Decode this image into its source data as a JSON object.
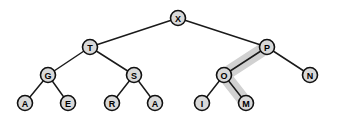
{
  "figure": {
    "kind": "binary-search-tree-diagram",
    "background_color": "#ffffff",
    "width": 338,
    "height": 125
  },
  "style": {
    "node_fill": "#d9d9d9",
    "node_stroke": "#111111",
    "edge_color": "#1a1a1a",
    "highlight_color": "#c9c9c9",
    "label_color": "#000000",
    "node_radius": 7.5
  },
  "nodes": [
    {
      "id": "X",
      "label": "X",
      "x": 178,
      "y": 18,
      "r": 7.5,
      "highlighted": false
    },
    {
      "id": "T",
      "label": "T",
      "x": 90,
      "y": 47,
      "r": 7.5,
      "highlighted": false
    },
    {
      "id": "P",
      "label": "P",
      "x": 267,
      "y": 47,
      "r": 7.5,
      "highlighted": true
    },
    {
      "id": "G",
      "label": "G",
      "x": 48,
      "y": 75,
      "r": 7.5,
      "highlighted": false
    },
    {
      "id": "S",
      "label": "S",
      "x": 134,
      "y": 75,
      "r": 7.5,
      "highlighted": false
    },
    {
      "id": "O",
      "label": "O",
      "x": 224,
      "y": 75,
      "r": 7.5,
      "highlighted": true
    },
    {
      "id": "N",
      "label": "N",
      "x": 310,
      "y": 75,
      "r": 7.5,
      "highlighted": false
    },
    {
      "id": "A1",
      "label": "A",
      "x": 25,
      "y": 103,
      "r": 7.5,
      "highlighted": false
    },
    {
      "id": "E",
      "label": "E",
      "x": 68,
      "y": 103,
      "r": 7.5,
      "highlighted": false
    },
    {
      "id": "R",
      "label": "R",
      "x": 112,
      "y": 103,
      "r": 7.5,
      "highlighted": false
    },
    {
      "id": "A2",
      "label": "A",
      "x": 155,
      "y": 103,
      "r": 7.5,
      "highlighted": false
    },
    {
      "id": "I",
      "label": "I",
      "x": 202,
      "y": 103,
      "r": 7.5,
      "highlighted": false
    },
    {
      "id": "M",
      "label": "M",
      "x": 246,
      "y": 103,
      "r": 7.5,
      "highlighted": true
    }
  ],
  "edges": [
    {
      "from": "X",
      "to": "T"
    },
    {
      "from": "X",
      "to": "P"
    },
    {
      "from": "T",
      "to": "G"
    },
    {
      "from": "T",
      "to": "S"
    },
    {
      "from": "P",
      "to": "O"
    },
    {
      "from": "P",
      "to": "N"
    },
    {
      "from": "G",
      "to": "A1"
    },
    {
      "from": "G",
      "to": "E"
    },
    {
      "from": "S",
      "to": "R"
    },
    {
      "from": "S",
      "to": "A2"
    },
    {
      "from": "O",
      "to": "I"
    },
    {
      "from": "O",
      "to": "M"
    }
  ],
  "highlight_path": {
    "nodes": [
      "P",
      "O",
      "M"
    ],
    "points": "267,47 224,75 246,103"
  }
}
